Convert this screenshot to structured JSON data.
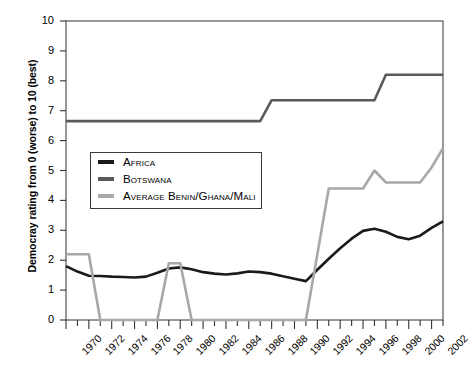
{
  "chart_data": {
    "type": "line",
    "title": "",
    "xlabel": "",
    "ylabel": "Democray rating from 0 (worse) to 10 (best)",
    "xlim": [
      1970,
      2003
    ],
    "ylim": [
      0,
      10
    ],
    "ytick_labels": [
      "0",
      "1",
      "2",
      "3",
      "4",
      "5",
      "6",
      "7",
      "8",
      "9",
      "10"
    ],
    "ytick_values": [
      0,
      1,
      2,
      3,
      4,
      5,
      6,
      7,
      8,
      9,
      10
    ],
    "xtick_labels": [
      "1970",
      "1972",
      "1974",
      "1976",
      "1978",
      "1980",
      "1982",
      "1984",
      "1986",
      "1988",
      "1990",
      "1992",
      "1994",
      "1996",
      "1998",
      "2000",
      "2002"
    ],
    "xtick_values": [
      1970,
      1972,
      1974,
      1976,
      1978,
      1980,
      1982,
      1984,
      1986,
      1988,
      1990,
      1992,
      1994,
      1996,
      1998,
      2000,
      2002
    ],
    "minor_xticks_every": 1,
    "grid": false,
    "legend_position": "upper-left-inside",
    "x": [
      1970,
      1971,
      1972,
      1973,
      1974,
      1975,
      1976,
      1977,
      1978,
      1979,
      1980,
      1981,
      1982,
      1983,
      1984,
      1985,
      1986,
      1987,
      1988,
      1989,
      1990,
      1991,
      1992,
      1993,
      1994,
      1995,
      1996,
      1997,
      1998,
      1999,
      2000,
      2001,
      2002,
      2003
    ],
    "series": [
      {
        "name": "Africa",
        "color": "#1a1a1a",
        "width": 2.6,
        "values": [
          1.8,
          1.62,
          1.48,
          1.47,
          1.45,
          1.44,
          1.42,
          1.45,
          1.58,
          1.72,
          1.76,
          1.7,
          1.6,
          1.55,
          1.52,
          1.56,
          1.62,
          1.6,
          1.55,
          1.46,
          1.38,
          1.3,
          1.68,
          2.05,
          2.4,
          2.72,
          2.98,
          3.05,
          2.95,
          2.78,
          2.7,
          2.82,
          3.08,
          3.3
        ]
      },
      {
        "name": "Botswana",
        "color": "#5a5a5a",
        "width": 2.6,
        "values": [
          6.65,
          6.65,
          6.65,
          6.65,
          6.65,
          6.65,
          6.65,
          6.65,
          6.65,
          6.65,
          6.65,
          6.65,
          6.65,
          6.65,
          6.65,
          6.65,
          6.65,
          6.65,
          7.35,
          7.35,
          7.35,
          7.35,
          7.35,
          7.35,
          7.35,
          7.35,
          7.35,
          7.35,
          8.2,
          8.2,
          8.2,
          8.2,
          8.2,
          8.2
        ]
      },
      {
        "name": "Average Benin/Ghana/Mali",
        "color": "#a8a8a8",
        "width": 2.6,
        "values": [
          2.2,
          2.2,
          2.2,
          0.0,
          0.0,
          0.0,
          0.0,
          0.0,
          0.0,
          1.9,
          1.9,
          0.0,
          0.0,
          0.0,
          0.0,
          0.0,
          0.0,
          0.0,
          0.0,
          0.0,
          0.0,
          0.0,
          2.2,
          4.4,
          4.4,
          4.4,
          4.4,
          5.0,
          4.6,
          4.6,
          4.6,
          4.6,
          5.1,
          5.75
        ]
      }
    ]
  },
  "legend": {
    "items": [
      {
        "label": "Africa",
        "color": "#1a1a1a"
      },
      {
        "label": "Botswana",
        "color": "#5a5a5a"
      },
      {
        "label": "Average Benin/Ghana/Mali",
        "color": "#a8a8a8"
      }
    ]
  }
}
